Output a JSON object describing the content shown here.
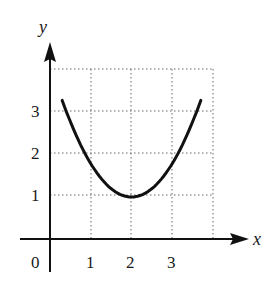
{
  "chart_data": {
    "type": "line",
    "title": "",
    "xlabel": "x",
    "ylabel": "y",
    "xlim": [
      0,
      4
    ],
    "ylim": [
      0,
      4
    ],
    "grid": true,
    "grid_style": "dotted",
    "x_ticks": [
      "0",
      "1",
      "2",
      "3"
    ],
    "y_ticks": [
      "1",
      "2",
      "3"
    ],
    "series": [
      {
        "name": "curve",
        "description": "parabola-like curve with minimum at (2, 1)",
        "x": [
          0.3,
          0.5,
          1.0,
          1.5,
          2.0,
          2.5,
          3.0,
          3.5,
          3.7
        ],
        "y": [
          3.3,
          2.8,
          1.8,
          1.2,
          1.0,
          1.2,
          1.8,
          2.8,
          3.3
        ]
      }
    ],
    "minimum": {
      "x": 2,
      "y": 1
    }
  },
  "labels": {
    "x_axis": "x",
    "y_axis": "y",
    "origin": "0",
    "x1": "1",
    "x2": "2",
    "x3": "3",
    "y1": "1",
    "y2": "2",
    "y3": "3"
  }
}
